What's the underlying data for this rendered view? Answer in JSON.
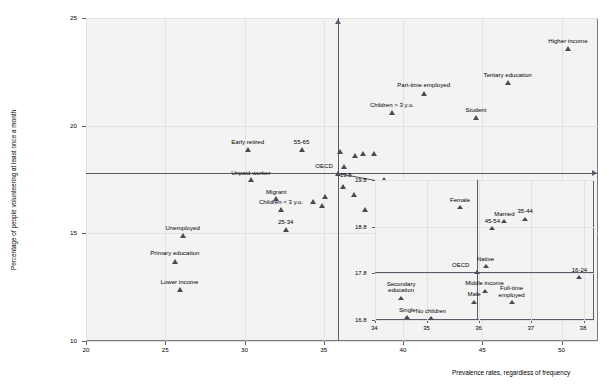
{
  "chart_data": {
    "type": "scatter",
    "title": "",
    "xlabel": "Prevalence rates, regardless of frequency",
    "ylabel": "Percentage of people volunteering at least once a month",
    "xlim": [
      20,
      39
    ],
    "ylim": [
      10,
      25
    ],
    "xticks": [
      20,
      25,
      30,
      35,
      40,
      45,
      50
    ],
    "yticks": [
      10,
      15,
      20,
      25
    ],
    "grid": true,
    "axis_crosshair": {
      "x": 35.9,
      "y": 17.8,
      "label": "OECD"
    },
    "points": [
      {
        "label": "Higher income",
        "x": 50.4,
        "y": 23.6,
        "label_pos": "above"
      },
      {
        "label": "Tertiary education",
        "x": 46.6,
        "y": 22.0,
        "label_pos": "above"
      },
      {
        "label": "Part-time employed",
        "x": 41.3,
        "y": 21.5,
        "label_pos": "above"
      },
      {
        "label": "Children > 3 y.o.",
        "x": 39.3,
        "y": 20.6,
        "label_pos": "above"
      },
      {
        "label": "Student",
        "x": 44.6,
        "y": 20.4,
        "label_pos": "above"
      },
      {
        "label": "Early retired",
        "x": 30.2,
        "y": 18.9,
        "label_pos": "above"
      },
      {
        "label": "55-65",
        "x": 33.6,
        "y": 18.9,
        "label_pos": "above"
      },
      {
        "label": "Unpaid worker",
        "x": 30.4,
        "y": 17.5,
        "label_pos": "above"
      },
      {
        "label": "Migrant",
        "x": 32.0,
        "y": 16.6,
        "label_pos": "above"
      },
      {
        "label": "Children < 3 y.o.",
        "x": 32.3,
        "y": 16.1,
        "label_pos": "above"
      },
      {
        "label": "25-34",
        "x": 32.6,
        "y": 15.2,
        "label_pos": "above"
      },
      {
        "label": "Unemployed",
        "x": 26.1,
        "y": 14.9,
        "label_pos": "above"
      },
      {
        "label": "Primary education",
        "x": 25.6,
        "y": 13.7,
        "label_pos": "above"
      },
      {
        "label": "Lower income",
        "x": 25.9,
        "y": 12.4,
        "label_pos": "above"
      },
      {
        "label": "",
        "x": 36.0,
        "y": 18.8
      },
      {
        "label": "",
        "x": 37.0,
        "y": 18.6
      },
      {
        "label": "",
        "x": 37.5,
        "y": 18.7
      },
      {
        "label": "",
        "x": 38.2,
        "y": 18.7
      },
      {
        "label": "",
        "x": 36.3,
        "y": 18.1
      },
      {
        "label": "",
        "x": 38.8,
        "y": 17.5
      },
      {
        "label": "",
        "x": 36.2,
        "y": 17.2
      },
      {
        "label": "",
        "x": 36.9,
        "y": 16.8
      },
      {
        "label": "",
        "x": 35.1,
        "y": 16.7
      },
      {
        "label": "",
        "x": 34.3,
        "y": 16.5
      },
      {
        "label": "",
        "x": 34.9,
        "y": 16.3
      },
      {
        "label": "",
        "x": 37.6,
        "y": 16.1
      }
    ],
    "inset": {
      "type": "scatter",
      "xlim": [
        34,
        38.2
      ],
      "ylim": [
        16.8,
        19.8
      ],
      "xticks": [
        34,
        35,
        36,
        37,
        38
      ],
      "yticks": [
        16.8,
        17.8,
        18.8,
        19.8
      ],
      "axis_crosshair": {
        "x": 35.95,
        "y": 17.83,
        "label": "OECD"
      },
      "points": [
        {
          "label": "Female",
          "x": 35.63,
          "y": 19.22,
          "label_pos": "above"
        },
        {
          "label": "Married",
          "x": 36.48,
          "y": 18.93,
          "label_pos": "above"
        },
        {
          "label": "35-44",
          "x": 36.88,
          "y": 18.98,
          "label_pos": "above"
        },
        {
          "label": "45-54",
          "x": 36.25,
          "y": 18.78,
          "label_pos": "above"
        },
        {
          "label": "Native",
          "x": 36.12,
          "y": 17.96,
          "label_pos": "above"
        },
        {
          "label": "16-24",
          "x": 37.92,
          "y": 17.72,
          "label_pos": "above"
        },
        {
          "label": "Middle income",
          "x": 36.1,
          "y": 17.44,
          "label_pos": "above"
        },
        {
          "label": "Full-time employed",
          "x": 36.62,
          "y": 17.19,
          "label_pos": "above"
        },
        {
          "label": "Male",
          "x": 35.9,
          "y": 17.2,
          "label_pos": "above"
        },
        {
          "label": "Secondary education",
          "x": 34.5,
          "y": 17.28,
          "label_pos": "above"
        },
        {
          "label": "Single",
          "x": 34.62,
          "y": 16.87,
          "label_pos": "above"
        },
        {
          "label": "No children",
          "x": 35.07,
          "y": 16.85,
          "label_pos": "above"
        }
      ]
    }
  },
  "colors": {
    "marker": "#4a4a52",
    "axis": "#5a5a6a",
    "grid": "#e2e2e2",
    "plot_background": "#f3f3f3",
    "frame": "#7a7a7a"
  }
}
